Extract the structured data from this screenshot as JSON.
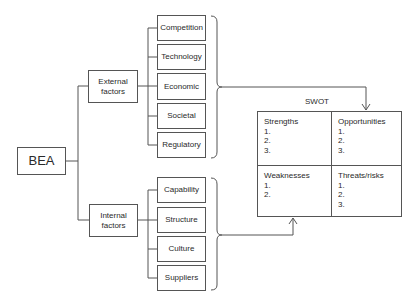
{
  "diagram": {
    "root": {
      "label": "BEA"
    },
    "external": {
      "label_line1": "External",
      "label_line2": "factors",
      "children": [
        "Competition",
        "Technology",
        "Economic",
        "Societal",
        "Regulatory"
      ]
    },
    "internal": {
      "label_line1": "Internal",
      "label_line2": "factors",
      "children": [
        "Capability",
        "Structure",
        "Culture",
        "Suppliers"
      ]
    },
    "swot": {
      "title": "SWOT",
      "quadrants": [
        {
          "heading": "Strengths",
          "items": [
            "1.",
            "2.",
            "3."
          ]
        },
        {
          "heading": "Opportunities",
          "items": [
            "1.",
            "2.",
            "3."
          ]
        },
        {
          "heading": "Weaknesses",
          "items": [
            "1.",
            "2."
          ]
        },
        {
          "heading": "Threats/risks",
          "items": [
            "1.",
            "2.",
            "3."
          ]
        }
      ]
    },
    "colors": {
      "line": "#555555",
      "text": "#2a2a2a",
      "background": "#ffffff"
    }
  }
}
